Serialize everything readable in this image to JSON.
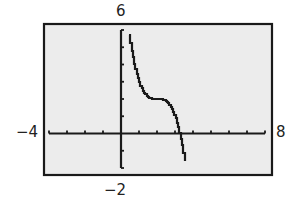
{
  "chart_data": {
    "type": "line",
    "title": "",
    "xlabel": "",
    "ylabel": "",
    "xlim": [
      -4,
      8
    ],
    "ylim": [
      -2,
      6
    ],
    "xscale": 1,
    "yscale": 1,
    "grid": false,
    "axis_labels": {
      "xmin": "−4",
      "xmax": "8",
      "ymax": "6",
      "ymin": "−2"
    },
    "series": [
      {
        "name": "f(x)",
        "description": "Decreasing cubic with horizontal inflection near (2, 2); approx y = -(x-2)^3 + 2",
        "x": [
          0.45,
          0.6,
          0.8,
          1.0,
          1.2,
          1.4,
          1.6,
          1.8,
          2.0,
          2.2,
          2.4,
          2.6,
          2.8,
          3.0,
          3.2,
          3.26,
          3.4,
          3.59
        ],
        "values": [
          5.72,
          4.74,
          3.73,
          3.0,
          2.51,
          2.22,
          2.06,
          2.01,
          2.0,
          1.99,
          1.94,
          1.78,
          1.49,
          1.0,
          0.27,
          0.0,
          -0.74,
          -2.0
        ]
      }
    ]
  },
  "colors": {
    "screen_bg": "#ececec",
    "frame": "#1a1a1a",
    "axis": "#1a1a1a",
    "curve": "#1a1a1a",
    "label": "#222222"
  }
}
